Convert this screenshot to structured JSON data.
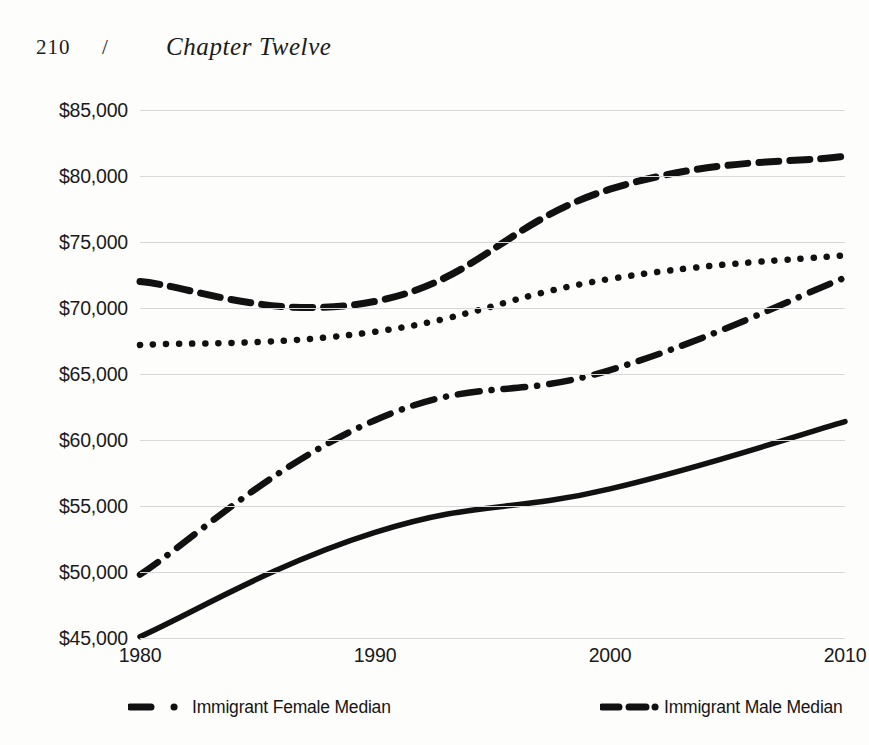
{
  "page": {
    "folio": "210",
    "separator": "/",
    "chapter_title": "Chapter Twelve"
  },
  "chart_data": {
    "type": "line",
    "title": "",
    "xlabel": "",
    "ylabel": "",
    "x": [
      1980,
      1990,
      2000,
      2010
    ],
    "xtick_labels": [
      "1980",
      "1990",
      "2000",
      "2010"
    ],
    "ytick_labels": [
      "$85,000",
      "$80,000",
      "$75,000",
      "$70,000",
      "$65,000",
      "$60,000",
      "$55,000",
      "$50,000",
      "$45,000"
    ],
    "ytick_values": [
      85000,
      80000,
      75000,
      70000,
      65000,
      60000,
      55000,
      50000,
      45000
    ],
    "ylim": [
      45000,
      85000
    ],
    "xlim": [
      1980,
      2010
    ],
    "grid": true,
    "legend_position": "bottom",
    "line_color": "#111111",
    "grid_color": "#d8d8d8",
    "series": [
      {
        "name": "Immigrant Male Median",
        "style": "dashed",
        "values": [
          72000,
          70500,
          79000,
          81500
        ]
      },
      {
        "name": "Native-Born Male Median",
        "style": "dotted",
        "values": [
          67200,
          68200,
          72200,
          74000
        ]
      },
      {
        "name": "Immigrant Female Median",
        "style": "dash-dot",
        "values": [
          49800,
          61500,
          65300,
          72300
        ]
      },
      {
        "name": "Native-Born Female Median",
        "style": "solid",
        "values": [
          45100,
          53000,
          56300,
          61400
        ]
      }
    ]
  },
  "legend": {
    "entries": [
      {
        "label": "Immigrant Female Median",
        "style": "dash-dot"
      },
      {
        "label": "Immigrant Male Median",
        "style": "dashed"
      }
    ]
  }
}
